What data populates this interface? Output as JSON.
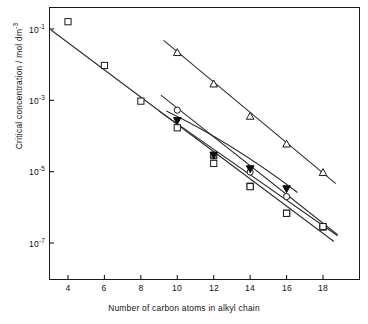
{
  "chart_data": {
    "type": "scatter",
    "title": "",
    "xlabel": "Number of carbon atoms in alkyl chain",
    "ylabel_prefix": "Critical concentration / mol dm",
    "ylabel_exponent": "-3",
    "ylabel_full": "Critical concentration / mol dm-3",
    "xlim": [
      3,
      19
    ],
    "ylim": [
      1e-08,
      0.3
    ],
    "yscale": "log",
    "xscale": "linear",
    "grid": false,
    "legend": "none",
    "xticks": [
      4,
      6,
      8,
      10,
      12,
      14,
      16,
      18
    ],
    "xtick_labels": [
      "4",
      "6",
      "8",
      "10",
      "12",
      "14",
      "16",
      "18"
    ],
    "yticks": [
      0.1,
      0.001,
      1e-05,
      1e-07
    ],
    "ytick_mantissa": [
      "10",
      "10",
      "10",
      "10"
    ],
    "ytick_exponents": [
      "-1",
      "-3",
      "-5",
      "-7"
    ],
    "ytick_labels": [
      "10-1",
      "10-3",
      "10-5",
      "10-7"
    ],
    "series": [
      {
        "name": "series-1-open-square-upper",
        "marker": "open-square",
        "x": [
          4,
          6,
          8,
          12,
          14,
          16,
          18
        ],
        "y": [
          0.16,
          0.0095,
          0.00095,
          2.8e-05,
          3.9e-06,
          6.8e-07,
          2.8e-07
        ],
        "line": {
          "x": [
            3.05,
            18.6
          ],
          "y": [
            0.095,
            1.1e-07
          ]
        },
        "has_line": true
      },
      {
        "name": "series-2-open-triangle",
        "marker": "open-triangle",
        "x": [
          10,
          12,
          14,
          16,
          18
        ],
        "y": [
          0.022,
          0.0029,
          0.00036,
          6e-05,
          9.5e-06
        ],
        "line": {
          "x": [
            9.25,
            18.7
          ],
          "y": [
            0.048,
            4.6e-06
          ]
        },
        "has_line": true
      },
      {
        "name": "series-3-open-circle",
        "marker": "open-circle",
        "x": [
          10,
          12,
          14,
          16,
          18
        ],
        "y": [
          0.00053,
          2.8e-05,
          9.8e-06,
          2e-06,
          2.9e-07
        ],
        "line": {
          "x": [
            9.1,
            18.8
          ],
          "y": [
            0.0014,
            1.7e-07
          ]
        },
        "has_line": true
      },
      {
        "name": "series-4-filled-triangle",
        "marker": "filled-triangle",
        "x": [
          10,
          12,
          14,
          16
        ],
        "y": [
          0.00027,
          2.9e-05,
          1.2e-05,
          3.3e-06
        ],
        "line": {
          "x": [
            9.4,
            16.6
          ],
          "y": [
            0.0005,
            2.6e-06
          ]
        },
        "has_line": true,
        "line_curved": true
      },
      {
        "name": "series-5-open-square-lower",
        "marker": "open-square",
        "x": [
          10,
          12,
          14,
          16,
          18
        ],
        "y": [
          0.00017,
          1.7e-05,
          3.8e-06,
          6.8e-07,
          2.9e-07
        ],
        "has_line": false
      }
    ],
    "marker_styles": {
      "open-square": "square outline, white fill",
      "open-circle": "circle outline, white fill",
      "open-triangle": "triangle outline, white fill",
      "filled-triangle": "triangle solid black fill"
    },
    "colors": {
      "axis": "#1a1a1a",
      "line": "#2a2a2a",
      "marker_edge": "#1a1a1a",
      "marker_fill": "#ffffff",
      "marker_fill_solid": "#0d0d0d",
      "background": "#ffffff"
    }
  }
}
